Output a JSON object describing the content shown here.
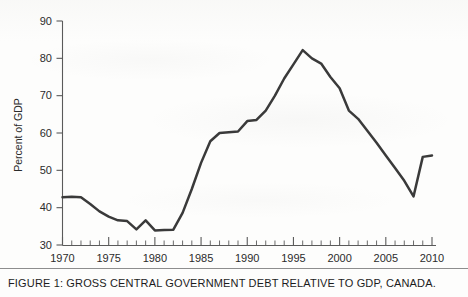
{
  "caption": {
    "text": "FIGURE 1:   GROSS CENTRAL GOVERNMENT DEBT RELATIVE TO GDP, CANADA."
  },
  "colors": {
    "line": "#3a3a3a",
    "axis": "#5a5a5a",
    "text": "#1c1c1c",
    "background": "#fdfdfc"
  },
  "chart_data": {
    "type": "line",
    "title": "",
    "xlabel": "",
    "ylabel": "Percent of GDP",
    "xlim": [
      1970,
      2010
    ],
    "ylim": [
      30,
      90
    ],
    "xticks": [
      1970,
      1975,
      1980,
      1985,
      1990,
      1995,
      2000,
      2005,
      2010
    ],
    "xtick_labels": [
      "1970",
      "1975",
      "1980",
      "1985",
      "1990",
      "1995",
      "2000",
      "2005",
      "2010"
    ],
    "x_minor_tick_step": 1,
    "yticks": [
      30,
      40,
      50,
      60,
      70,
      80,
      90
    ],
    "ytick_labels": [
      "30",
      "40",
      "50",
      "60",
      "70",
      "80",
      "90"
    ],
    "grid": false,
    "legend": false,
    "legend_position": "none",
    "series": [
      {
        "name": "Gross central government debt, percent of GDP",
        "x": [
          1970,
          1971,
          1972,
          1973,
          1974,
          1975,
          1976,
          1977,
          1978,
          1979,
          1980,
          1981,
          1982,
          1983,
          1984,
          1985,
          1986,
          1987,
          1988,
          1989,
          1990,
          1991,
          1992,
          1993,
          1994,
          1995,
          1996,
          1997,
          1998,
          1999,
          2000,
          2001,
          2002,
          2003,
          2004,
          2005,
          2006,
          2007,
          2008,
          2009,
          2010
        ],
        "values": [
          42.8,
          42.9,
          42.8,
          41.0,
          39.0,
          37.6,
          36.6,
          36.4,
          34.2,
          36.6,
          33.9,
          34.0,
          34.1,
          38.6,
          45.0,
          52.0,
          57.8,
          60.0,
          60.2,
          60.4,
          63.2,
          63.5,
          66.0,
          70.0,
          74.6,
          78.4,
          82.2,
          80.0,
          78.6,
          75.0,
          72.0,
          66.0,
          63.8,
          60.6,
          57.4,
          54.0,
          50.6,
          47.2,
          43.0,
          53.6,
          54.0
        ]
      }
    ]
  }
}
